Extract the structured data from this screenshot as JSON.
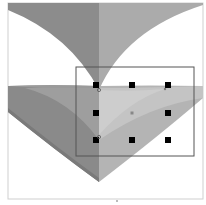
{
  "canvas": {
    "background": "#ffffff",
    "border_color": "#cfcfcf",
    "bounds": {
      "x": 8,
      "y": 3,
      "w": 195,
      "h": 196
    }
  },
  "shapes": {
    "upper_v": {
      "left_fill": "#8c8c8c",
      "right_fill": "#ababab"
    },
    "lower_band": {
      "left_fill": "#9a9a9a",
      "right_fill": "#bdbdbd",
      "inner_fill": "#c8c8c8"
    },
    "lower_v": {
      "left_fill": "#8a8a8a",
      "right_fill": "#b4b4b4",
      "edge_fill": "#7a7a7a"
    }
  },
  "selection": {
    "box": {
      "x": 76,
      "y": 67,
      "w": 118,
      "h": 89
    },
    "stroke": "#555555",
    "handles": [
      {
        "name": "handle-top-left",
        "x": 96,
        "y": 85
      },
      {
        "name": "handle-top-center",
        "x": 132,
        "y": 85
      },
      {
        "name": "handle-top-right",
        "x": 168,
        "y": 85
      },
      {
        "name": "handle-middle-left",
        "x": 96,
        "y": 113
      },
      {
        "name": "handle-middle-right",
        "x": 168,
        "y": 113
      },
      {
        "name": "handle-bottom-left",
        "x": 96,
        "y": 140
      },
      {
        "name": "handle-bottom-center",
        "x": 132,
        "y": 140
      },
      {
        "name": "handle-bottom-right",
        "x": 168,
        "y": 140
      }
    ],
    "center_point": {
      "x": 132,
      "y": 113,
      "color": "#888888"
    },
    "anchor_points": [
      {
        "x": 99,
        "y": 90
      },
      {
        "x": 165,
        "y": 89
      },
      {
        "x": 99,
        "y": 137
      }
    ]
  },
  "bottom_marker": {
    "x": 117,
    "y": 201
  }
}
